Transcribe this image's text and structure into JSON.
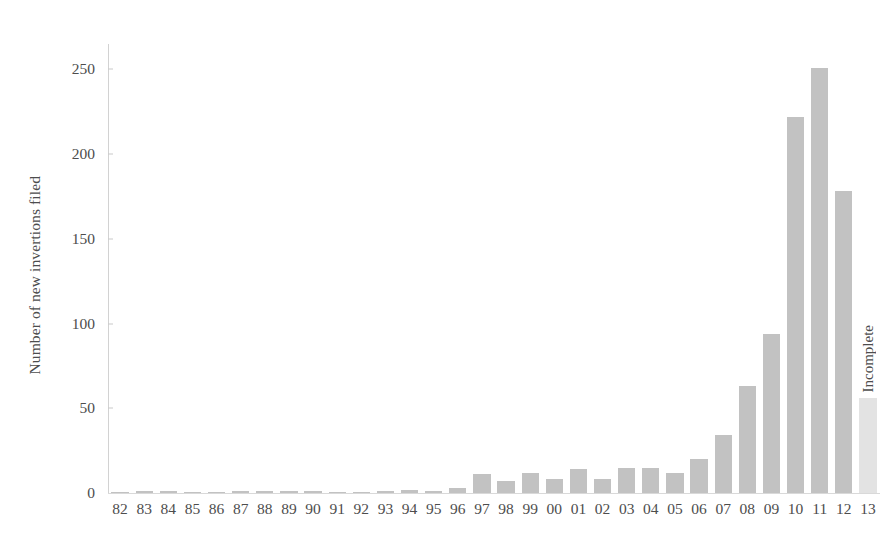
{
  "chart_data": {
    "type": "bar",
    "title": "",
    "subtitle": "",
    "xlabel": "",
    "ylabel": "Number of new invertions filed",
    "categories": [
      "82",
      "83",
      "84",
      "85",
      "86",
      "87",
      "88",
      "89",
      "90",
      "91",
      "92",
      "93",
      "94",
      "95",
      "96",
      "97",
      "98",
      "99",
      "00",
      "01",
      "02",
      "03",
      "04",
      "05",
      "06",
      "07",
      "08",
      "09",
      "10",
      "11",
      "12",
      "13"
    ],
    "values": [
      0,
      1,
      1,
      0,
      0,
      1,
      1,
      1,
      1,
      0,
      0,
      1,
      2,
      1,
      3,
      11,
      7,
      12,
      8,
      14,
      8,
      15,
      15,
      12,
      20,
      34,
      63,
      94,
      222,
      251,
      178,
      56
    ],
    "ylim": [
      0,
      265
    ],
    "yticks": [
      0,
      50,
      100,
      150,
      200,
      250
    ],
    "ytick_labels": [
      "0",
      "50",
      "100",
      "150",
      "200",
      "250"
    ],
    "grid": false,
    "legend": null,
    "annotations": [
      {
        "category": "13",
        "text": "Incomplete"
      }
    ],
    "series_colors": {
      "bar": "#c2c2c2",
      "incomplete_bar": "#e3e3e3"
    },
    "axis_color": "#d2d2d2",
    "text_color": "#4d4d4d",
    "background": "#ffffff"
  }
}
